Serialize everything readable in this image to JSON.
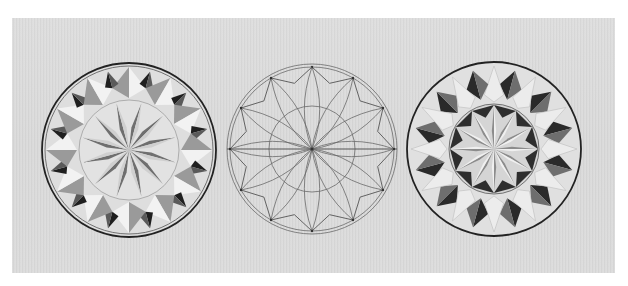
{
  "image": {
    "description": "Photo of a light wood board with three 12-point chip-carving rosettes: a carved rosette (left), a pencil layout drawing (middle), and a second carved rosette variation (right)",
    "background_color": "#ffffff",
    "board_color": "#d9d9d9",
    "ink_color": "#2a2a2a",
    "pencil_color": "#6a6a6a"
  },
  "rosettes": [
    {
      "id": "left",
      "type": "carved",
      "cx": 129,
      "cy": 150,
      "r_outer": 87,
      "r_inner": 50,
      "points": 12,
      "style": "outer star chips + inner sunburst"
    },
    {
      "id": "middle",
      "type": "pencil-layout",
      "cx": 312,
      "cy": 149,
      "r_outer": 85,
      "r_outer2": 82,
      "r_inner": 43,
      "points": 12,
      "style": "construction lines with lens petals"
    },
    {
      "id": "right",
      "type": "carved",
      "cx": 494,
      "cy": 149,
      "r_outer": 87,
      "r_inner": 45,
      "points": 12,
      "style": "outer petals + inner sunburst with dark triangles"
    }
  ]
}
